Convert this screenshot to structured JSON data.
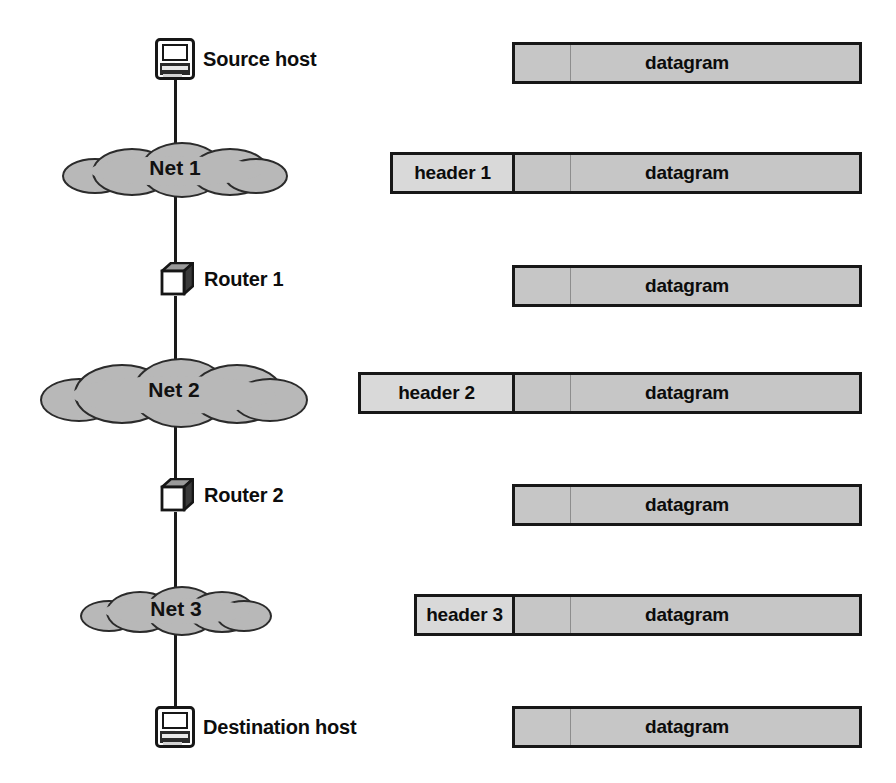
{
  "figure": {
    "colors": {
      "line": "#1a1a1a",
      "cloud_fill": "#b8b8b8",
      "cloud_stroke": "#2b2b2b",
      "header_fill": "#d9d9d9",
      "payload_fill": "#c6c6c6",
      "box_stroke": "#171717",
      "text": "#0c0c0c",
      "background": "#ffffff"
    }
  },
  "topology": {
    "nodes": [
      {
        "id": "source-host",
        "kind": "host",
        "label": "Source host"
      },
      {
        "id": "net-1",
        "kind": "cloud",
        "label": "Net 1"
      },
      {
        "id": "router-1",
        "kind": "router",
        "label": "Router 1"
      },
      {
        "id": "net-2",
        "kind": "cloud",
        "label": "Net 2"
      },
      {
        "id": "router-2",
        "kind": "router",
        "label": "Router 2"
      },
      {
        "id": "net-3",
        "kind": "cloud",
        "label": "Net 3"
      },
      {
        "id": "destination-host",
        "kind": "host",
        "label": "Destination host"
      }
    ]
  },
  "packets": {
    "rows": [
      {
        "id": "pdu-source-host",
        "stage": "source-host",
        "header": null,
        "payload": "datagram"
      },
      {
        "id": "pdu-net-1",
        "stage": "net-1",
        "header": "header 1",
        "payload": "datagram"
      },
      {
        "id": "pdu-router-1",
        "stage": "router-1",
        "header": null,
        "payload": "datagram"
      },
      {
        "id": "pdu-net-2",
        "stage": "net-2",
        "header": "header 2",
        "payload": "datagram"
      },
      {
        "id": "pdu-router-2",
        "stage": "router-2",
        "header": null,
        "payload": "datagram"
      },
      {
        "id": "pdu-net-3",
        "stage": "net-3",
        "header": "header 3",
        "payload": "datagram"
      },
      {
        "id": "pdu-destination-host",
        "stage": "destination-host",
        "header": null,
        "payload": "datagram"
      }
    ]
  }
}
